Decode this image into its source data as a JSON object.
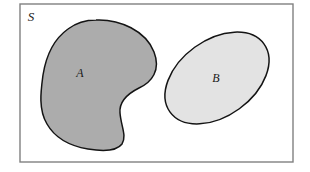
{
  "figure": {
    "type": "set-diagram",
    "background_color": "#ffffff"
  },
  "universe": {
    "label": "S",
    "name": "universal-set",
    "frame": {
      "x": 20,
      "y": 4,
      "width": 273,
      "height": 158,
      "stroke": "#808080",
      "stroke_width": 1.4,
      "fill": "#ffffff"
    },
    "label_position": {
      "x": 31,
      "y": 21
    }
  },
  "sets": [
    {
      "id": "set-a",
      "label": "A",
      "shape": "blob",
      "fill": "#ACACAC",
      "stroke": "#141414",
      "stroke_width": 1.5,
      "label_position": {
        "x": 80,
        "y": 77
      },
      "path": "M 96 20 C 120 19 146 31 154 52 C 161 70 152 82 139 88 C 127 94 119 102 120 113 C 121 126 127 136 122 144 C 116 152 100 151 88 149 C 70 146 55 138 47 124 C 38 109 41 90 43 75 C 46 56 54 39 68 29 C 76 23 86 20 96 20 Z"
    },
    {
      "id": "set-b",
      "label": "B",
      "shape": "ellipse",
      "fill": "#E3E3E3",
      "stroke": "#141414",
      "stroke_width": 1.5,
      "label_position": {
        "x": 216,
        "y": 82
      },
      "ellipse": {
        "cx": 217,
        "cy": 78,
        "rx": 58,
        "ry": 38,
        "rotation_deg": -36
      }
    }
  ],
  "colors": {
    "set_a_fill": "#ACACAC",
    "set_b_fill": "#E3E3E3",
    "outline": "#141414",
    "frame_stroke": "#808080",
    "label_color": "#1a1a1a",
    "page_background": "#ffffff"
  }
}
